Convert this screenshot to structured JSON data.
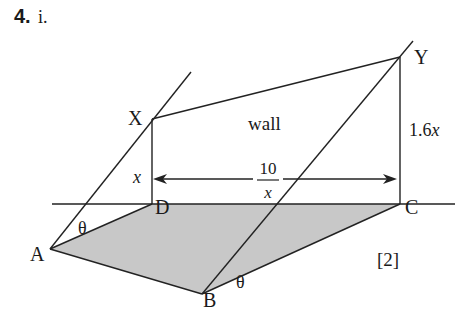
{
  "question": {
    "number": "4.",
    "part": "i.",
    "marks": "[2]"
  },
  "labels": {
    "wall": "wall",
    "X": "X",
    "Y": "Y",
    "A": "A",
    "B": "B",
    "C": "C",
    "D": "D",
    "theta_A": "θ",
    "theta_B": "θ",
    "height_XD": "x",
    "height_YC": "1.6x",
    "width_numerator": "10",
    "width_denominator": "x"
  },
  "colors": {
    "shaded_floor": "#c8c8c8",
    "stroke": "#222222",
    "text": "#1a1a1a"
  }
}
